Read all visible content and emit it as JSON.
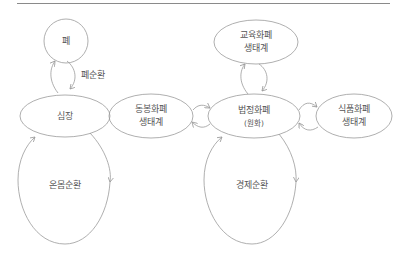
{
  "diagram": {
    "style": {
      "stroke": "#9a9a9a",
      "rule": "#8a8a8a",
      "text": "#555555"
    },
    "left": {
      "lung": {
        "label": "폐"
      },
      "pulmonary_loop": {
        "label": "폐순환"
      },
      "heart": {
        "label": "심장"
      },
      "systemic_loop": {
        "label": "온몸순환"
      }
    },
    "right": {
      "education": {
        "line1": "교육화폐",
        "line2": "생태계"
      },
      "legal": {
        "line1": "법정화폐",
        "line2": "(원화)"
      },
      "mutual": {
        "line1": "동봉화폐",
        "line2": "생태계"
      },
      "food": {
        "line1": "식품화폐",
        "line2": "생태계"
      },
      "economic_loop": {
        "label": "경제순환"
      }
    }
  }
}
